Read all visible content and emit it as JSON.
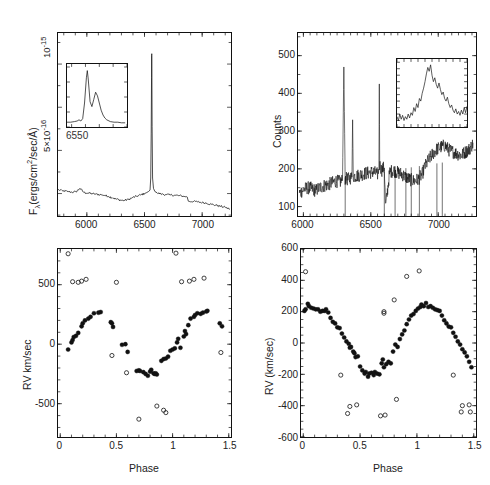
{
  "figure": {
    "caption": "",
    "background": "#ffffff",
    "ink": "#111111"
  },
  "panels": [
    {
      "id": "top-left-spectrum",
      "role": "flux-calibrated-spectrum",
      "ylabel": "Fλ(ergs/cm²/sec/Å)",
      "ylabel_parts": {
        "base": "F",
        "sub": "λ",
        "rest": "(ergs/cm",
        "exp": "2",
        "tail": "/sec/Å)"
      },
      "xlabel": "",
      "xticks": [
        6000,
        6500,
        7000
      ],
      "xticklabels": [
        "6000",
        "6500",
        "7000"
      ],
      "yticks": [
        5e-16,
        1e-15
      ],
      "yticklabels": [
        "5×10⁻¹⁶",
        "10⁻¹⁵"
      ],
      "yticklabel_parts": [
        {
          "mant": "5×10",
          "exp": "-16"
        },
        {
          "mant": "10",
          "exp": "-15"
        }
      ],
      "xlim": [
        5750,
        7250
      ],
      "ylim": [
        1.2e-16,
        1.18e-15
      ],
      "inset": {
        "label": "6550",
        "description": "double-peaked H-alpha emission profile"
      }
    },
    {
      "id": "top-right-spectrum",
      "role": "counts-spectrum",
      "ylabel": "Counts",
      "xlabel": "",
      "xticks": [
        6000,
        6500,
        7000
      ],
      "xticklabels": [
        "6000",
        "6500",
        "7000"
      ],
      "yticks": [
        100,
        200,
        300,
        400,
        500
      ],
      "yticklabels": [
        "100",
        "200",
        "300",
        "400",
        "500"
      ],
      "xlim": [
        5960,
        7280
      ],
      "ylim": [
        75,
        560
      ],
      "inset": {
        "label": "",
        "description": "noisy single-peaked emission line"
      }
    },
    {
      "id": "bottom-left-rv",
      "role": "radial-velocity-curve",
      "ylabel": "RV km/sec",
      "xlabel": "Phase",
      "xticks": [
        0,
        0.5,
        1,
        1.5
      ],
      "xticklabels": [
        "0",
        "0.5",
        "1",
        "1.5"
      ],
      "yticks": [
        -500,
        0,
        500
      ],
      "yticklabels": [
        "-500",
        "0",
        "500"
      ],
      "xlim": [
        -0.02,
        1.52
      ],
      "ylim": [
        -780,
        800
      ]
    },
    {
      "id": "bottom-right-rv",
      "role": "radial-velocity-curve",
      "ylabel": "RV (km/sec)",
      "xlabel": "Phase",
      "xticks": [
        0,
        0.5,
        1,
        1.5
      ],
      "xticklabels": [
        "0",
        "0.5",
        "1",
        "1.5"
      ],
      "yticks": [
        -600,
        -400,
        -200,
        0,
        200,
        400,
        600
      ],
      "yticklabels": [
        "-600",
        "-400",
        "-200",
        "0",
        "200",
        "400",
        "600"
      ],
      "xlim": [
        -0.02,
        1.52
      ],
      "ylim": [
        -600,
        600
      ]
    }
  ],
  "chart_data": [
    {
      "id": "top-left-spectrum",
      "type": "line",
      "title": "",
      "xlabel": "",
      "ylabel": "Fλ(ergs/cm²/sec/Å)",
      "xlim": [
        5750,
        7250
      ],
      "ylim": [
        1.2e-16,
        1.18e-15
      ],
      "grid": false,
      "legend": null,
      "note": "Continuum near 2.6e-16 with a very strong narrow H-alpha emission line at 6563 A reaching ~1.05e-15",
      "series": [
        {
          "name": "flux",
          "x": [
            5750,
            5790,
            5830,
            5870,
            5905,
            5940,
            5975,
            6010,
            6045,
            6080,
            6115,
            6150,
            6185,
            6220,
            6255,
            6290,
            6325,
            6360,
            6395,
            6430,
            6465,
            6500,
            6520,
            6535,
            6548,
            6554,
            6558,
            6561,
            6562,
            6563,
            6564,
            6566,
            6570,
            6578,
            6590,
            6610,
            6640,
            6680,
            6720,
            6760,
            6800,
            6840,
            6870,
            6880,
            6920,
            6960,
            7000,
            7040,
            7080,
            7120,
            7160,
            7200,
            7240
          ],
          "y": [
            2.72e-16,
            2.66e-16,
            2.62e-16,
            2.58e-16,
            2.6e-16,
            2.8e-16,
            2.56e-16,
            2.52e-16,
            2.5e-16,
            2.46e-16,
            2.44e-16,
            2.4e-16,
            2.34e-16,
            2.26e-16,
            2.18e-16,
            2.12e-16,
            2.1e-16,
            2.16e-16,
            2.26e-16,
            2.34e-16,
            2.42e-16,
            2.5e-16,
            2.56e-16,
            2.62e-16,
            2.7e-16,
            3.4e-16,
            6e-16,
            9.2e-16,
            1.05e-15,
            1.06e-15,
            9.6e-16,
            6.4e-16,
            3.4e-16,
            2.8e-16,
            2.62e-16,
            2.54e-16,
            2.48e-16,
            2.44e-16,
            2.42e-16,
            2.4e-16,
            2.38e-16,
            2.34e-16,
            2.3e-16,
            2.06e-16,
            2.04e-16,
            2.02e-16,
            1.98e-16,
            1.94e-16,
            1.88e-16,
            1.82e-16,
            1.76e-16,
            1.7e-16,
            1.6e-16
          ]
        }
      ],
      "inset": {
        "type": "line",
        "xlabel": "6550",
        "xlim": [
          6535,
          6600
        ],
        "note": "double-peaked H-alpha profile, blue peak stronger than red peak",
        "x": [
          6535,
          6539,
          6543,
          6546,
          6548,
          6550,
          6552,
          6554,
          6556,
          6557,
          6558,
          6560,
          6562,
          6564,
          6566,
          6568,
          6570,
          6572,
          6574,
          6576,
          6578,
          6582,
          6586,
          6590,
          6594,
          6598
        ],
        "y": [
          0.08,
          0.08,
          0.09,
          0.1,
          0.12,
          0.1,
          0.14,
          0.4,
          0.82,
          0.94,
          0.8,
          0.42,
          0.34,
          0.46,
          0.58,
          0.52,
          0.4,
          0.28,
          0.2,
          0.15,
          0.12,
          0.09,
          0.08,
          0.08,
          0.07,
          0.07
        ]
      }
    },
    {
      "id": "top-right-spectrum",
      "type": "line",
      "title": "",
      "xlabel": "",
      "ylabel": "Counts",
      "xlim": [
        5960,
        7280
      ],
      "ylim": [
        75,
        560
      ],
      "grid": false,
      "legend": null,
      "note": "Noisy counts spectrum, continuum rising from ~140 at 6000 to ~250 at 7100; strong sky/cosmic-ray spikes near 6300 (to 470), 6365, 6563 (to 425) and several deep negative spikes",
      "series": [
        {
          "name": "counts",
          "x": [
            5970,
            6000,
            6030,
            6060,
            6090,
            6120,
            6150,
            6180,
            6210,
            6240,
            6270,
            6290,
            6300,
            6310,
            6330,
            6360,
            6365,
            6370,
            6400,
            6430,
            6460,
            6490,
            6520,
            6550,
            6560,
            6563,
            6566,
            6580,
            6600,
            6610,
            6640,
            6670,
            6700,
            6730,
            6760,
            6790,
            6820,
            6850,
            6880,
            6900,
            6930,
            6960,
            6990,
            7020,
            7050,
            7080,
            7110,
            7140,
            7170,
            7200,
            7230,
            7260
          ],
          "y": [
            135,
            145,
            150,
            148,
            142,
            150,
            155,
            158,
            162,
            168,
            165,
            170,
            470,
            175,
            172,
            178,
            330,
            180,
            182,
            185,
            188,
            190,
            192,
            186,
            200,
            425,
            210,
            196,
            205,
            100,
            192,
            196,
            190,
            186,
            178,
            172,
            168,
            172,
            185,
            205,
            225,
            240,
            252,
            258,
            262,
            250,
            245,
            240,
            236,
            244,
            252,
            268
          ]
        }
      ],
      "inset": {
        "type": "line",
        "note": "noisy emission line peaking near the centre with a secondary shoulder on the red side",
        "x": [
          0,
          2,
          4,
          6,
          8,
          10,
          12,
          14,
          16,
          18,
          20,
          22,
          24,
          26,
          28,
          30,
          32,
          34,
          36,
          38,
          40,
          42,
          44,
          46,
          48,
          50,
          52,
          54,
          56,
          58,
          60,
          62,
          64,
          66,
          68,
          70,
          72,
          74,
          76,
          78,
          80,
          82,
          84,
          86,
          88,
          90,
          92,
          94,
          96,
          98,
          100
        ],
        "y": [
          0.16,
          0.1,
          0.2,
          0.12,
          0.18,
          0.1,
          0.16,
          0.12,
          0.2,
          0.14,
          0.22,
          0.18,
          0.3,
          0.24,
          0.36,
          0.3,
          0.44,
          0.4,
          0.52,
          0.6,
          0.7,
          0.82,
          0.92,
          0.86,
          0.96,
          0.8,
          0.7,
          0.76,
          0.66,
          0.6,
          0.68,
          0.58,
          0.5,
          0.54,
          0.44,
          0.4,
          0.46,
          0.36,
          0.3,
          0.34,
          0.26,
          0.22,
          0.28,
          0.2,
          0.24,
          0.18,
          0.26,
          0.2,
          0.3,
          0.22,
          0.32
        ]
      }
    },
    {
      "id": "bottom-left-rv",
      "type": "scatter",
      "title": "",
      "xlabel": "Phase",
      "ylabel": "RV km/sec",
      "xlim": [
        -0.02,
        1.52
      ],
      "ylim": [
        -780,
        800
      ],
      "grid": false,
      "legend": null,
      "series": [
        {
          "name": "filled-circles",
          "marker": "filled-circle",
          "x": [
            0.07,
            0.1,
            0.11,
            0.12,
            0.14,
            0.16,
            0.19,
            0.2,
            0.22,
            0.25,
            0.27,
            0.3,
            0.34,
            0.36,
            0.45,
            0.46,
            0.47,
            0.55,
            0.58,
            0.6,
            0.68,
            0.7,
            0.71,
            0.74,
            0.76,
            0.78,
            0.8,
            0.81,
            0.83,
            0.84,
            0.85,
            0.86,
            0.9,
            0.92,
            0.94,
            0.96,
            0.98,
            1.0,
            1.02,
            1.04,
            1.05,
            1.07,
            1.1,
            1.11,
            1.12,
            1.14,
            1.16,
            1.19,
            1.2,
            1.22,
            1.25,
            1.27,
            1.3,
            1.31,
            1.42,
            1.44
          ],
          "y": [
            -45,
            15,
            35,
            60,
            70,
            95,
            150,
            175,
            200,
            215,
            230,
            260,
            265,
            270,
            185,
            175,
            145,
            -5,
            0,
            -65,
            -225,
            -220,
            -225,
            -235,
            -250,
            -265,
            -230,
            -215,
            -245,
            -250,
            -245,
            -255,
            -140,
            -125,
            -120,
            -105,
            -55,
            -45,
            -35,
            15,
            45,
            -30,
            65,
            110,
            85,
            160,
            215,
            230,
            245,
            260,
            255,
            265,
            275,
            280,
            175,
            150
          ]
        },
        {
          "name": "open-circles",
          "marker": "open-circle",
          "x": [
            0.07,
            0.11,
            0.16,
            0.19,
            0.23,
            0.46,
            0.5,
            0.59,
            0.7,
            0.86,
            0.92,
            0.94,
            1.03,
            1.08,
            1.15,
            1.19,
            1.28,
            1.43
          ],
          "y": [
            760,
            525,
            520,
            530,
            545,
            -95,
            520,
            -240,
            -630,
            -520,
            -555,
            -575,
            765,
            525,
            530,
            545,
            555,
            -70
          ]
        }
      ]
    },
    {
      "id": "bottom-right-rv",
      "type": "scatter",
      "title": "",
      "xlabel": "Phase",
      "ylabel": "RV (km/sec)",
      "xlim": [
        -0.02,
        1.52
      ],
      "ylim": [
        -600,
        600
      ],
      "grid": false,
      "legend": null,
      "series": [
        {
          "name": "filled-circles",
          "marker": "filled-circle",
          "x": [
            0.01,
            0.02,
            0.04,
            0.05,
            0.07,
            0.09,
            0.11,
            0.13,
            0.15,
            0.17,
            0.19,
            0.2,
            0.22,
            0.24,
            0.26,
            0.28,
            0.3,
            0.32,
            0.34,
            0.36,
            0.38,
            0.4,
            0.41,
            0.42,
            0.44,
            0.45,
            0.46,
            0.48,
            0.5,
            0.52,
            0.54,
            0.55,
            0.57,
            0.58,
            0.6,
            0.62,
            0.63,
            0.65,
            0.67,
            0.69,
            0.7,
            0.71,
            0.73,
            0.75,
            0.77,
            0.79,
            0.81,
            0.83,
            0.85,
            0.87,
            0.89,
            0.91,
            0.93,
            0.95,
            0.97,
            0.99,
            1.01,
            1.03,
            1.04,
            1.06,
            1.08,
            1.1,
            1.12,
            1.14,
            1.16,
            1.18,
            1.2,
            1.22,
            1.24,
            1.26,
            1.28,
            1.3,
            1.32,
            1.34,
            1.36,
            1.38,
            1.4,
            1.42,
            1.44,
            1.46,
            1.48
          ],
          "y": [
            205,
            215,
            250,
            235,
            225,
            220,
            215,
            215,
            200,
            205,
            205,
            215,
            195,
            160,
            135,
            125,
            100,
            95,
            60,
            35,
            10,
            -5,
            -30,
            -25,
            -55,
            -65,
            -90,
            -85,
            -150,
            -175,
            -195,
            -185,
            -215,
            -195,
            -190,
            -205,
            -185,
            -195,
            -200,
            -130,
            -105,
            -155,
            -135,
            -120,
            -130,
            -55,
            -10,
            -25,
            25,
            55,
            80,
            120,
            150,
            175,
            185,
            205,
            220,
            230,
            245,
            235,
            255,
            230,
            235,
            225,
            215,
            210,
            205,
            175,
            145,
            125,
            105,
            100,
            65,
            40,
            10,
            -10,
            -40,
            -60,
            -85,
            -120,
            -155
          ]
        },
        {
          "name": "open-circles",
          "marker": "open-circle",
          "x": [
            0.02,
            0.33,
            0.39,
            0.41,
            0.47,
            0.68,
            0.71,
            0.71,
            0.72,
            0.8,
            0.82,
            0.91,
            1.02,
            1.32,
            1.39,
            1.4,
            1.46,
            1.47
          ],
          "y": [
            455,
            -205,
            -450,
            -405,
            -395,
            -465,
            190,
            200,
            -460,
            275,
            -360,
            425,
            460,
            -205,
            -440,
            -400,
            -395,
            -440
          ]
        }
      ]
    }
  ]
}
